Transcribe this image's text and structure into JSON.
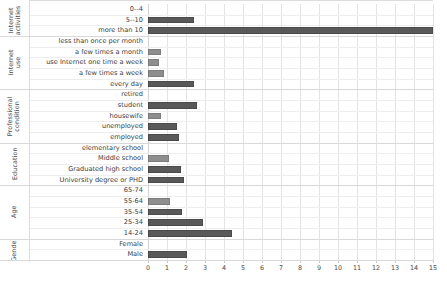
{
  "chart_data": {
    "type": "bar",
    "orientation": "horizontal",
    "title": "",
    "xlabel": "",
    "ylabel": "",
    "xlim": [
      0,
      15
    ],
    "xticks": [
      0,
      1,
      2,
      3,
      4,
      5,
      6,
      7,
      8,
      9,
      10,
      11,
      12,
      13,
      14,
      15
    ],
    "grid": true,
    "legend": "none",
    "bar_color": "#595959",
    "bar_color_light": "#8e8e8e",
    "groups": [
      {
        "name": "Internet activities",
        "categories": [
          "0--4",
          "5--10",
          "more than 10"
        ],
        "values": [
          0,
          2.4,
          15.0
        ]
      },
      {
        "name": "Internet use",
        "categories": [
          "less than once per month",
          "a few times a  month",
          "use Internet one time a  week",
          "a few times a  week",
          "every day"
        ],
        "values": [
          0,
          0.7,
          0.6,
          0.85,
          2.4
        ]
      },
      {
        "name": "Professional condition",
        "categories": [
          "retired",
          "student",
          "housewife",
          "unemployed",
          "employed"
        ],
        "values": [
          0,
          2.6,
          0.7,
          1.5,
          1.65
        ]
      },
      {
        "name": "Education",
        "categories": [
          "elementary school",
          "Middle school",
          "Graduated high school",
          "University degree or PHD"
        ],
        "values": [
          0,
          1.1,
          1.75,
          1.9
        ]
      },
      {
        "name": "Age",
        "categories": [
          "65-74",
          "55-64",
          "35-54",
          "25-34",
          "14-24"
        ],
        "values": [
          0,
          1.15,
          1.8,
          2.9,
          4.4
        ]
      },
      {
        "name": "Gender",
        "categories": [
          "Female",
          "Male"
        ],
        "values": [
          0,
          2.05
        ]
      }
    ]
  }
}
